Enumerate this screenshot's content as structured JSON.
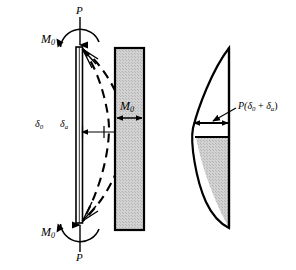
{
  "figure": {
    "colors": {
      "stroke": "#000000",
      "shade_fill": "#cfcfcf",
      "background": "#ffffff",
      "column_fill": "#ffffff"
    },
    "panels": [
      {
        "id": "deflected-column",
        "name": "Deflected column with end moments",
        "description": "Slender column loaded axially by P at both ends with end moments M0, showing initial and additional deflected shapes as dashed curves."
      },
      {
        "id": "primary-moment-diagram",
        "name": "Primary (uniform) bending moment diagram",
        "description": "Uniform shaded rectangular moment diagram of constant magnitude M0 along the column length."
      },
      {
        "id": "secondary-moment-diagram",
        "name": "Secondary moment diagram",
        "description": "Crescent shaped moment diagram showing the additional P-delta moment P(delta_0 + delta_a)."
      }
    ],
    "labels": {
      "load_top": "P",
      "moment_top": "M",
      "moment_top_sub": "0",
      "load_bottom": "P",
      "moment_bottom": "M",
      "moment_bottom_sub": "0",
      "deflection_initial": "δ",
      "deflection_initial_sub": "0",
      "deflection_additional": "δ",
      "deflection_additional_sub": "a",
      "uniform_moment": "M",
      "uniform_moment_sub": "0",
      "p_delta_prefix": "P(",
      "p_delta_d1": "δ",
      "p_delta_d1_sub": "0",
      "p_delta_plus": " + ",
      "p_delta_d2": "δ",
      "p_delta_d2_sub": "a",
      "p_delta_suffix": ")"
    }
  }
}
